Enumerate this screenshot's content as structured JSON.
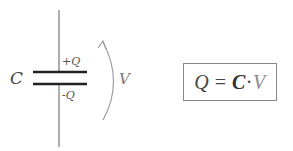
{
  "diagram": {
    "capacitor": {
      "label": "C",
      "top_plate_charge": "+Q",
      "bottom_plate_charge": "-Q"
    },
    "voltage": {
      "label": "V",
      "arrow": "curved-arrow-up"
    },
    "formula": {
      "lhs": "Q",
      "equals": "=",
      "factor1": "C",
      "operator": "·",
      "factor2": "V"
    },
    "colors": {
      "wire": "#777777",
      "plate": "#222222",
      "arrow": "#999999",
      "box_border": "#888888",
      "text": "#555555"
    }
  }
}
